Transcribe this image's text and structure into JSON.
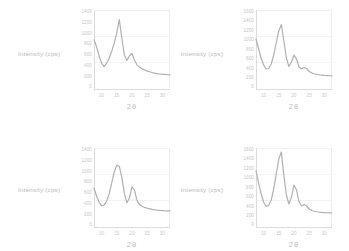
{
  "figure": {
    "background": "#ffffff",
    "curve_color": "#b0b0b0",
    "axis_color": "#dcdcdc",
    "label_color": "#c2c2c2"
  },
  "chart_data": [
    {
      "type": "line",
      "panel": "top-left",
      "title": "",
      "xlabel": "2θ",
      "ylabel": "Intensity (cps)",
      "xlim": [
        5,
        35
      ],
      "ylim": [
        0,
        1400
      ],
      "xticks": [
        "10",
        "15",
        "20",
        "25",
        "30"
      ],
      "yticks": [
        "1400",
        "1200",
        "1000",
        "800",
        "600",
        "400",
        "200",
        "0"
      ],
      "grid": true,
      "legend": "none",
      "x": [
        5,
        6,
        7,
        8,
        9,
        10,
        11,
        12,
        13,
        14,
        15,
        16,
        17,
        18,
        19,
        20,
        21,
        22,
        23,
        24,
        25,
        26,
        27,
        28,
        29,
        30,
        31,
        32,
        33,
        34,
        35
      ],
      "y": [
        880,
        760,
        600,
        470,
        410,
        470,
        560,
        680,
        820,
        1010,
        1230,
        900,
        610,
        520,
        600,
        640,
        520,
        440,
        400,
        370,
        350,
        330,
        320,
        305,
        295,
        285,
        280,
        275,
        272,
        268,
        265
      ]
    },
    {
      "type": "line",
      "panel": "top-right",
      "title": "",
      "xlabel": "2θ",
      "ylabel": "Intensity (cps)",
      "xlim": [
        5,
        35
      ],
      "ylim": [
        0,
        1600
      ],
      "xticks": [
        "10",
        "15",
        "20",
        "25",
        "30"
      ],
      "yticks": [
        "1600",
        "1400",
        "1200",
        "1000",
        "800",
        "600",
        "400",
        "200",
        "0"
      ],
      "grid": true,
      "legend": "none",
      "x": [
        5,
        6,
        7,
        8,
        9,
        10,
        11,
        12,
        13,
        14,
        15,
        16,
        17,
        18,
        19,
        20,
        21,
        22,
        23,
        24,
        25,
        26,
        27,
        28,
        29,
        30,
        31,
        32,
        33,
        34,
        35
      ],
      "y": [
        1020,
        830,
        640,
        500,
        420,
        430,
        520,
        700,
        950,
        1180,
        1310,
        980,
        640,
        470,
        560,
        700,
        620,
        460,
        420,
        450,
        430,
        370,
        340,
        325,
        315,
        305,
        298,
        292,
        288,
        285,
        282
      ]
    },
    {
      "type": "line",
      "panel": "bottom-left",
      "title": "",
      "xlabel": "2θ",
      "ylabel": "Intensity (cps)",
      "xlim": [
        5,
        35
      ],
      "ylim": [
        0,
        1400
      ],
      "xticks": [
        "10",
        "15",
        "20",
        "25",
        "30"
      ],
      "yticks": [
        "1400",
        "1200",
        "1000",
        "800",
        "600",
        "400",
        "200",
        "0"
      ],
      "grid": true,
      "legend": "none",
      "x": [
        5,
        6,
        7,
        8,
        9,
        10,
        11,
        12,
        13,
        14,
        15,
        16,
        17,
        18,
        19,
        20,
        21,
        22,
        23,
        24,
        25,
        26,
        27,
        28,
        29,
        30,
        31,
        32,
        33,
        34,
        35
      ],
      "y": [
        700,
        560,
        450,
        390,
        400,
        470,
        600,
        790,
        980,
        1100,
        1080,
        880,
        600,
        440,
        530,
        720,
        660,
        480,
        410,
        380,
        360,
        345,
        335,
        325,
        318,
        312,
        308,
        305,
        302,
        300,
        298
      ]
    },
    {
      "type": "line",
      "panel": "bottom-right",
      "title": "",
      "xlabel": "2θ",
      "ylabel": "Intensity (cps)",
      "xlim": [
        5,
        35
      ],
      "ylim": [
        0,
        1600
      ],
      "xticks": [
        "10",
        "15",
        "20",
        "25",
        "30"
      ],
      "yticks": [
        "1600",
        "1400",
        "1200",
        "1000",
        "800",
        "600",
        "400",
        "200",
        "0"
      ],
      "grid": true,
      "legend": "none",
      "x": [
        5,
        6,
        7,
        8,
        9,
        10,
        11,
        12,
        13,
        14,
        15,
        16,
        17,
        18,
        19,
        20,
        21,
        22,
        23,
        24,
        25,
        26,
        27,
        28,
        29,
        30,
        31,
        32,
        33,
        34,
        35
      ],
      "y": [
        1150,
        900,
        690,
        520,
        430,
        450,
        560,
        780,
        1080,
        1380,
        1520,
        1050,
        660,
        480,
        620,
        860,
        760,
        520,
        440,
        470,
        440,
        380,
        350,
        335,
        325,
        318,
        312,
        308,
        305,
        302,
        300
      ]
    }
  ]
}
